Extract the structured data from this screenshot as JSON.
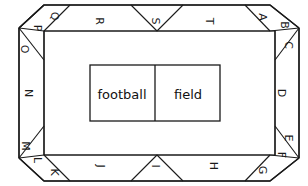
{
  "diagram": {
    "stroke_color": "#1a1a1a",
    "fill_color": "#ffffff",
    "field": {
      "left_box_label": "football",
      "right_box_label": "field"
    },
    "sections": [
      {
        "id": "A",
        "label": "A",
        "edge": "top",
        "x": 262,
        "y": 17,
        "rotation": 90
      },
      {
        "id": "B",
        "label": "B",
        "edge": "corner-top-right",
        "x": 284,
        "y": 25,
        "rotation": 90
      },
      {
        "id": "C",
        "label": "C",
        "edge": "right",
        "x": 288,
        "y": 45,
        "rotation": 90
      },
      {
        "id": "D",
        "label": "D",
        "edge": "right",
        "x": 281,
        "y": 93,
        "rotation": 90
      },
      {
        "id": "E",
        "label": "E",
        "edge": "right",
        "x": 288,
        "y": 138,
        "rotation": 90
      },
      {
        "id": "F",
        "label": "F",
        "edge": "corner-bottom-right",
        "x": 281,
        "y": 155,
        "rotation": 90
      },
      {
        "id": "G",
        "label": "G",
        "edge": "bottom",
        "x": 262,
        "y": 170,
        "rotation": 90
      },
      {
        "id": "H",
        "label": "H",
        "edge": "bottom",
        "x": 213,
        "y": 166,
        "rotation": 90
      },
      {
        "id": "I",
        "label": "I",
        "edge": "bottom",
        "x": 155,
        "y": 166,
        "rotation": 90
      },
      {
        "id": "J",
        "label": "J",
        "edge": "bottom",
        "x": 100,
        "y": 166,
        "rotation": 90
      },
      {
        "id": "K",
        "label": "K",
        "edge": "corner-bottom-left",
        "x": 54,
        "y": 172,
        "rotation": 90
      },
      {
        "id": "L",
        "label": "L",
        "edge": "bottom",
        "x": 37,
        "y": 160,
        "rotation": 90
      },
      {
        "id": "M",
        "label": "M",
        "edge": "left",
        "x": 25,
        "y": 146,
        "rotation": 90
      },
      {
        "id": "N",
        "label": "N",
        "edge": "left",
        "x": 28,
        "y": 93,
        "rotation": 90
      },
      {
        "id": "O",
        "label": "O",
        "edge": "left",
        "x": 24,
        "y": 49,
        "rotation": 90
      },
      {
        "id": "P",
        "label": "P",
        "edge": "corner-top-left",
        "x": 37,
        "y": 28,
        "rotation": 90
      },
      {
        "id": "Q",
        "label": "Q",
        "edge": "top",
        "x": 54,
        "y": 16,
        "rotation": 90
      },
      {
        "id": "R",
        "label": "R",
        "edge": "top",
        "x": 99,
        "y": 21,
        "rotation": 90
      },
      {
        "id": "S",
        "label": "S",
        "edge": "top",
        "x": 155,
        "y": 21,
        "rotation": 90
      },
      {
        "id": "T",
        "label": "T",
        "edge": "top",
        "x": 209,
        "y": 21,
        "rotation": 90
      }
    ]
  }
}
